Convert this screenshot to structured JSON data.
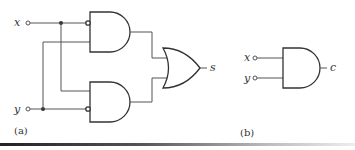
{
  "figure": {
    "part_a": {
      "caption": "(a)",
      "inputs": [
        {
          "name": "x",
          "label": "x"
        },
        {
          "name": "y",
          "label": "y"
        }
      ],
      "gates": [
        {
          "type": "AND",
          "id": "and_top",
          "inverted_inputs": [
            "x"
          ],
          "inputs": [
            "x",
            "y"
          ]
        },
        {
          "type": "AND",
          "id": "and_bottom",
          "inverted_inputs": [
            "y"
          ],
          "inputs": [
            "x",
            "y"
          ]
        },
        {
          "type": "OR",
          "id": "or_out",
          "inputs": [
            "and_top",
            "and_bottom"
          ]
        }
      ],
      "output": {
        "name": "s",
        "label": "s"
      }
    },
    "part_b": {
      "caption": "(b)",
      "inputs": [
        {
          "name": "x",
          "label": "x"
        },
        {
          "name": "y",
          "label": "y"
        }
      ],
      "gates": [
        {
          "type": "AND",
          "id": "and_c",
          "inputs": [
            "x",
            "y"
          ]
        }
      ],
      "output": {
        "name": "c",
        "label": "c"
      }
    }
  }
}
